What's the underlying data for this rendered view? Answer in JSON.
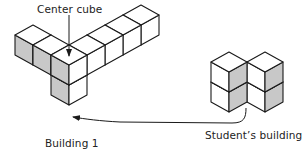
{
  "labels": {
    "center_cube": "Center cube",
    "building_1": "Building 1",
    "students_building": "Student’s building"
  },
  "colors": {
    "stroke": "#1a1a1a",
    "top_face": "#ffffff",
    "light_face": "#ffffff",
    "shaded_face": "#c8c8c8"
  },
  "iso": {
    "ux": 18,
    "uy": 10,
    "h": 20
  },
  "building_1": {
    "origin": [
      15,
      35
    ],
    "cubes": [
      {
        "a": 0,
        "b": 0,
        "z": 0
      },
      {
        "a": 1,
        "b": 0,
        "z": 0
      },
      {
        "a": 2,
        "b": 0,
        "z": 0
      },
      {
        "a": 2,
        "b": 1,
        "z": 0
      },
      {
        "a": 2,
        "b": 2,
        "z": 0
      },
      {
        "a": 2,
        "b": 3,
        "z": 0
      },
      {
        "a": 2,
        "b": 4,
        "z": 0
      },
      {
        "a": 2,
        "b": 0,
        "z": -1
      }
    ]
  },
  "students_building": {
    "origin": [
      211,
      52
    ],
    "cubes": [
      {
        "a": 0,
        "b": 0,
        "z": 0
      },
      {
        "a": 0,
        "b": 0,
        "z": -1
      },
      {
        "a": 1,
        "b": 3,
        "z": 0
      },
      {
        "a": 1,
        "b": 3,
        "z": -1
      }
    ]
  },
  "arrows": {
    "center_pointer": {
      "from": [
        69,
        15
      ],
      "to": [
        69,
        56
      ]
    },
    "student_to_b1": {
      "path": "M 246 108 C 246 118, 244 123, 232 123 L 120 122 C 100 121, 85 119, 73 117"
    }
  }
}
